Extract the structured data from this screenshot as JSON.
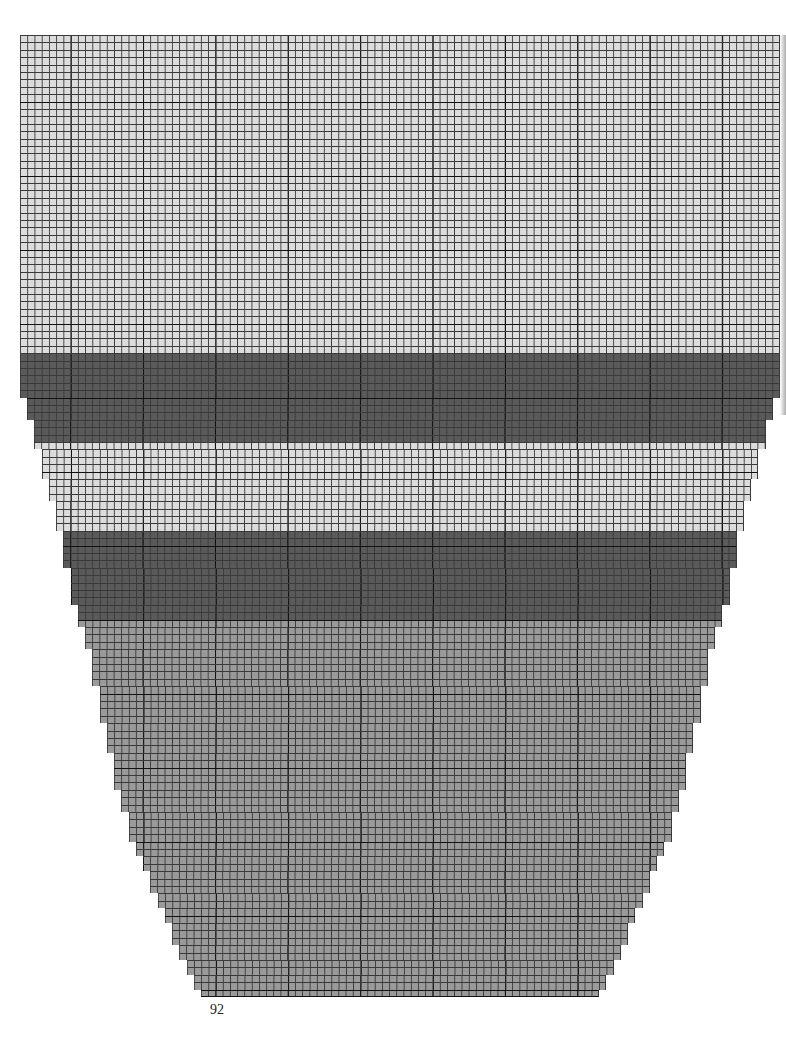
{
  "page": {
    "page_number": "92"
  },
  "chart": {
    "type": "knitting-chart",
    "columns": 105,
    "rows": 130,
    "cell_width": 7.24,
    "cell_height": 7.4,
    "origin": [
      20,
      35
    ],
    "major_grid_every": 10,
    "major_col_offset": 7,
    "major_row_offset": 9,
    "colors": {
      "light": "#dcdcdc",
      "dark": "#5a5a5a",
      "medium": "#9a9a9a",
      "grid_minor": "#3a3a3a",
      "grid_major": "#111111"
    },
    "bands": [
      {
        "name": "light-top",
        "color": "light",
        "start_row": 0,
        "end_row": 43
      },
      {
        "name": "dark-stripe-1",
        "color": "dark",
        "start_row": 43,
        "end_row": 55
      },
      {
        "name": "light-stripe",
        "color": "light",
        "start_row": 55,
        "end_row": 67
      },
      {
        "name": "dark-stripe-2",
        "color": "dark",
        "start_row": 67,
        "end_row": 79
      },
      {
        "name": "medium-bottom",
        "color": "medium",
        "start_row": 79,
        "end_row": 130
      }
    ],
    "shaping_insets": [
      [
        49,
        1
      ],
      [
        52,
        2
      ],
      [
        56,
        3
      ],
      [
        60,
        4
      ],
      [
        63,
        5
      ],
      [
        67,
        6
      ],
      [
        72,
        7
      ],
      [
        77,
        8
      ],
      [
        80,
        9
      ],
      [
        83,
        10
      ],
      [
        88,
        11
      ],
      [
        93,
        12
      ],
      [
        97,
        13
      ],
      [
        102,
        14
      ],
      [
        105,
        15
      ],
      [
        109,
        16
      ],
      [
        111,
        17
      ],
      [
        113,
        18
      ],
      [
        116,
        19
      ],
      [
        118,
        20
      ],
      [
        120,
        21
      ],
      [
        123,
        22
      ],
      [
        125,
        23
      ],
      [
        127,
        24
      ],
      [
        129,
        25
      ]
    ]
  }
}
